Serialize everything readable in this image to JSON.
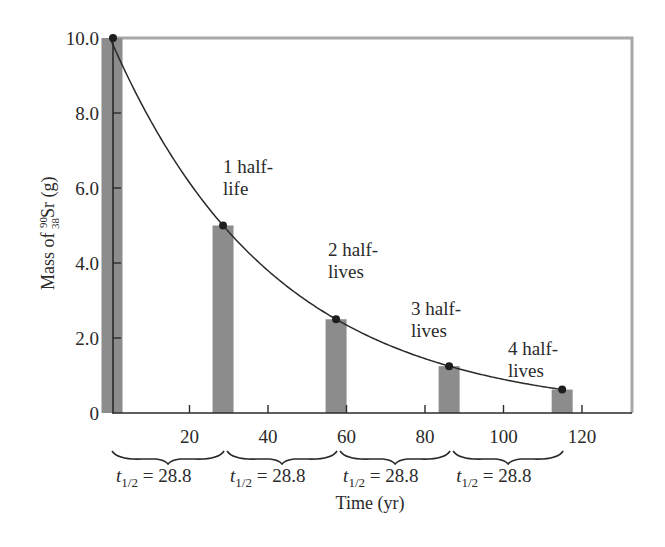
{
  "chart_data": {
    "type": "bar",
    "title": "",
    "xlabel": "Time (yr)",
    "ylabel": "Mass of 90/38 Sr (g)",
    "ylabel_parts": {
      "prefix": "Mass of ",
      "mass_number": "90",
      "atomic_number": "38",
      "symbol": "Sr",
      "unit": " (g)"
    },
    "xlim": [
      0,
      130
    ],
    "ylim": [
      0,
      10.0
    ],
    "x_ticks": [
      20,
      40,
      60,
      80,
      100,
      120
    ],
    "x_tick_labels": [
      "20",
      "40",
      "60",
      "80",
      "100",
      "120"
    ],
    "y_ticks": [
      0,
      2.0,
      4.0,
      6.0,
      8.0,
      10.0
    ],
    "y_tick_labels": [
      "0",
      "2.0",
      "4.0",
      "6.0",
      "8.0",
      "10.0"
    ],
    "grid": false,
    "legend": null,
    "bars": {
      "x": [
        0,
        28.8,
        57.6,
        86.4,
        115.2
      ],
      "values": [
        10.0,
        5.0,
        2.5,
        1.25,
        0.625
      ]
    },
    "curve": {
      "type": "exponential-decay",
      "initial": 10.0,
      "half_life": 28.8
    },
    "points": [
      {
        "x": 0,
        "y": 10.0
      },
      {
        "x": 28.8,
        "y": 5.0
      },
      {
        "x": 57.6,
        "y": 2.5
      },
      {
        "x": 86.4,
        "y": 1.25
      },
      {
        "x": 115.2,
        "y": 0.625
      }
    ],
    "annotations": [
      {
        "line1": "1 half-",
        "line2": "life",
        "x": 28.8
      },
      {
        "line1": "2 half-",
        "line2": "lives",
        "x": 57.6
      },
      {
        "line1": "3 half-",
        "line2": "lives",
        "x": 86.4
      },
      {
        "line1": "4 half-",
        "line2": "lives",
        "x": 115.2
      }
    ],
    "half_life_brackets": [
      {
        "from": 0,
        "to": 28.8,
        "label_var": "t",
        "label_sub": "1/2",
        "label_value": " = 28.8"
      },
      {
        "from": 28.8,
        "to": 57.6,
        "label_var": "t",
        "label_sub": "1/2",
        "label_value": " = 28.8"
      },
      {
        "from": 57.6,
        "to": 86.4,
        "label_var": "t",
        "label_sub": "1/2",
        "label_value": " = 28.8"
      },
      {
        "from": 86.4,
        "to": 115.2,
        "label_var": "t",
        "label_sub": "1/2",
        "label_value": " = 28.8"
      }
    ],
    "colors": {
      "bar": "#8c8c8c",
      "frame": "#a8a8a8",
      "axis": "#2a2a2a",
      "curve": "#2a2a2a",
      "point": "#1e1e1e"
    }
  }
}
